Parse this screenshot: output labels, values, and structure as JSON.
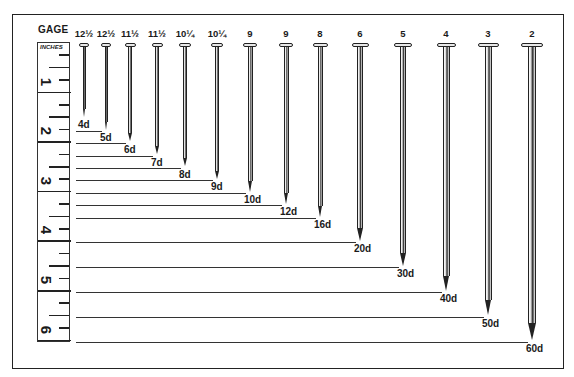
{
  "title": "GAGE",
  "ruler": {
    "unit_label": "INCHES",
    "inch_labels": [
      "1",
      "2",
      "3",
      "4",
      "5",
      "6"
    ]
  },
  "colors": {
    "ink": "#1a1a1a",
    "background": "#ffffff"
  },
  "nails": [
    {
      "size": "4d",
      "gage": "12½",
      "length_in": 1.5
    },
    {
      "size": "5d",
      "gage": "12½",
      "length_in": 1.75
    },
    {
      "size": "6d",
      "gage": "11½",
      "length_in": 2
    },
    {
      "size": "7d",
      "gage": "11½",
      "length_in": 2.25
    },
    {
      "size": "8d",
      "gage": "10¼",
      "length_in": 2.5
    },
    {
      "size": "9d",
      "gage": "10¼",
      "length_in": 2.75
    },
    {
      "size": "10d",
      "gage": "9",
      "length_in": 3
    },
    {
      "size": "12d",
      "gage": "9",
      "length_in": 3.25
    },
    {
      "size": "16d",
      "gage": "8",
      "length_in": 3.5
    },
    {
      "size": "20d",
      "gage": "6",
      "length_in": 4
    },
    {
      "size": "30d",
      "gage": "5",
      "length_in": 4.5
    },
    {
      "size": "40d",
      "gage": "4",
      "length_in": 5
    },
    {
      "size": "50d",
      "gage": "3",
      "length_in": 5.5
    },
    {
      "size": "60d",
      "gage": "2",
      "length_in": 6
    }
  ]
}
